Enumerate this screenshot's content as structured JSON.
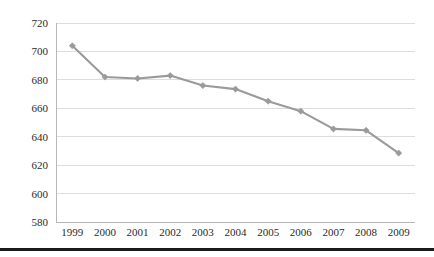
{
  "chart_data": {
    "type": "line",
    "title": "",
    "subtitle": "",
    "xlabel": "",
    "ylabel": "",
    "categories": [
      "1999",
      "2000",
      "2001",
      "2002",
      "2003",
      "2004",
      "2005",
      "2006",
      "2007",
      "2008",
      "2009"
    ],
    "values": [
      704,
      682,
      681,
      683,
      676,
      673.5,
      665,
      658,
      645.5,
      644.5,
      628.5
    ],
    "series": [
      {
        "name": "",
        "values": [
          704,
          682,
          681,
          683,
          676,
          673.5,
          665,
          658,
          645.5,
          644.5,
          628.5
        ]
      }
    ],
    "ylim": [
      580,
      720
    ],
    "ytick_values": [
      720,
      700,
      680,
      660,
      640,
      620,
      600,
      580
    ],
    "ytick_labels": [
      "720",
      "700",
      "680",
      "660",
      "640",
      "620",
      "600",
      "580"
    ],
    "xtick_labels": [
      "1999",
      "2000",
      "2001",
      "2002",
      "2003",
      "2004",
      "2005",
      "2006",
      "2007",
      "2008",
      "2009"
    ],
    "grid": true,
    "grid_axis": "y",
    "legend": false,
    "legend_position": "none",
    "markers": "diamond",
    "line_color": "#9a9a9a",
    "marker_color": "#9a9a9a",
    "grid_color": "#d4d4d4",
    "axis_color": "#b0b0b0",
    "text_color": "#2b2b2b",
    "background_color": "#ffffff",
    "annotations": []
  },
  "figure": {
    "bottom_rule_color": "#1a1a1a"
  }
}
